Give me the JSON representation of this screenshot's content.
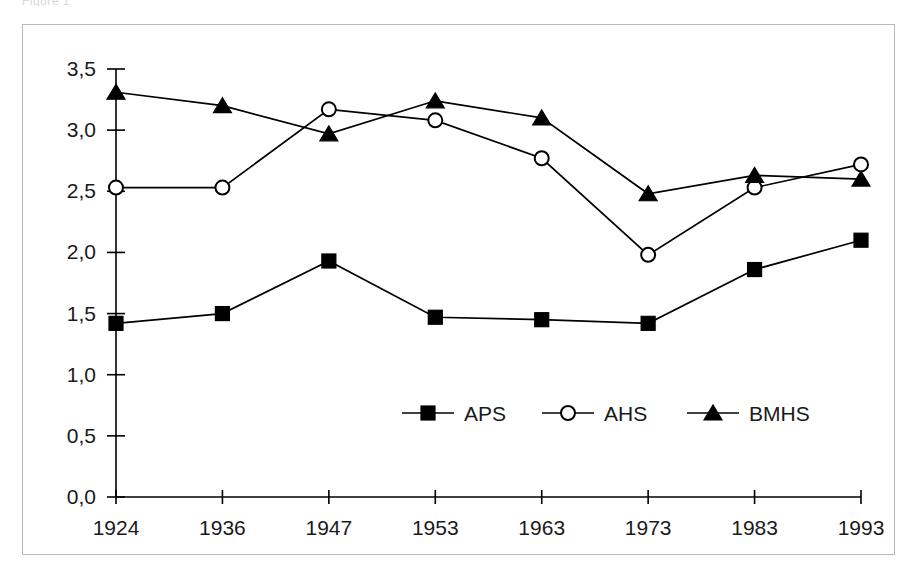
{
  "top_caption": "Figure 1",
  "chart_data": {
    "type": "line",
    "title": "",
    "subtitle": "",
    "xlabel": "",
    "ylabel": "",
    "categories": [
      "1924",
      "1936",
      "1947",
      "1953",
      "1963",
      "1973",
      "1983",
      "1993"
    ],
    "ylim": [
      0.0,
      3.5
    ],
    "ytick_labels": [
      "0,0",
      "0,5",
      "1,0",
      "1,5",
      "2,0",
      "2,5",
      "3,0",
      "3,5"
    ],
    "ytick_values": [
      0.0,
      0.5,
      1.0,
      1.5,
      2.0,
      2.5,
      3.0,
      3.5
    ],
    "grid": false,
    "legend_position": "inside-bottom-center",
    "decimal_separator": ",",
    "series": [
      {
        "name": "APS",
        "marker": "filled-square",
        "values": [
          1.42,
          1.5,
          1.93,
          1.47,
          1.45,
          1.42,
          1.86,
          2.1
        ]
      },
      {
        "name": "AHS",
        "marker": "open-circle",
        "values": [
          2.53,
          2.53,
          3.17,
          3.08,
          2.77,
          1.98,
          2.53,
          2.72
        ]
      },
      {
        "name": "BMHS",
        "marker": "filled-triangle",
        "values": [
          3.31,
          3.2,
          2.97,
          3.24,
          3.1,
          2.48,
          2.63,
          2.6
        ]
      }
    ]
  },
  "legend": {
    "entries": [
      {
        "label": "APS",
        "marker": "filled-square"
      },
      {
        "label": "AHS",
        "marker": "open-circle"
      },
      {
        "label": "BMHS",
        "marker": "filled-triangle"
      }
    ]
  },
  "colors": {
    "ink": "#000000",
    "frame": "#b9b9b9",
    "background": "#ffffff"
  }
}
